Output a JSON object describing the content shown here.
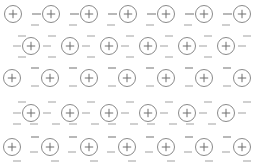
{
  "figure": {
    "width": 256,
    "height": 167,
    "background_color": "#ffffff",
    "ion_symbol": "+",
    "electron_symbol": "-",
    "ion_outline_color": "#8a8a8a",
    "ion_symbol_color": "#6f6f6f",
    "electron_color": "#9a9a9a",
    "ion_radius": 8.5,
    "ion_count": 33,
    "electron_count": 76,
    "row_count": 5
  },
  "lattice": {
    "rows": [
      {
        "index": 0,
        "label": "row-1",
        "y": 14,
        "start_x": 13,
        "spacing": 38.2,
        "ion_count": 7,
        "offset": "aligned"
      },
      {
        "index": 1,
        "label": "row-2",
        "y": 46,
        "start_x": 31,
        "spacing": 39.0,
        "ion_count": 6,
        "offset": "staggered"
      },
      {
        "index": 2,
        "label": "row-3",
        "y": 78,
        "start_x": 12,
        "spacing": 38.3,
        "ion_count": 7,
        "offset": "aligned"
      },
      {
        "index": 3,
        "label": "row-4",
        "y": 113,
        "start_x": 31,
        "spacing": 39.0,
        "ion_count": 6,
        "offset": "staggered"
      },
      {
        "index": 4,
        "label": "row-5",
        "y": 147,
        "start_x": 12,
        "spacing": 38.3,
        "ion_count": 7,
        "offset": "aligned"
      }
    ],
    "ions": [
      {
        "row": 0,
        "col": 0,
        "cx": 13,
        "cy": 14,
        "charge": "+"
      },
      {
        "row": 0,
        "col": 1,
        "cx": 51,
        "cy": 14,
        "charge": "+"
      },
      {
        "row": 0,
        "col": 2,
        "cx": 89,
        "cy": 14,
        "charge": "+"
      },
      {
        "row": 0,
        "col": 3,
        "cx": 128,
        "cy": 14,
        "charge": "+"
      },
      {
        "row": 0,
        "col": 4,
        "cx": 166,
        "cy": 14,
        "charge": "+"
      },
      {
        "row": 0,
        "col": 5,
        "cx": 204,
        "cy": 14,
        "charge": "+"
      },
      {
        "row": 0,
        "col": 6,
        "cx": 242,
        "cy": 14,
        "charge": "+"
      },
      {
        "row": 1,
        "col": 0,
        "cx": 31,
        "cy": 46,
        "charge": "+"
      },
      {
        "row": 1,
        "col": 1,
        "cx": 70,
        "cy": 46,
        "charge": "+"
      },
      {
        "row": 1,
        "col": 2,
        "cx": 109,
        "cy": 46,
        "charge": "+"
      },
      {
        "row": 1,
        "col": 3,
        "cx": 148,
        "cy": 46,
        "charge": "+"
      },
      {
        "row": 1,
        "col": 4,
        "cx": 187,
        "cy": 46,
        "charge": "+"
      },
      {
        "row": 1,
        "col": 5,
        "cx": 226,
        "cy": 46,
        "charge": "+"
      },
      {
        "row": 2,
        "col": 0,
        "cx": 12,
        "cy": 78,
        "charge": "+"
      },
      {
        "row": 2,
        "col": 1,
        "cx": 50,
        "cy": 78,
        "charge": "+"
      },
      {
        "row": 2,
        "col": 2,
        "cx": 89,
        "cy": 78,
        "charge": "+"
      },
      {
        "row": 2,
        "col": 3,
        "cx": 127,
        "cy": 78,
        "charge": "+"
      },
      {
        "row": 2,
        "col": 4,
        "cx": 166,
        "cy": 78,
        "charge": "+"
      },
      {
        "row": 2,
        "col": 5,
        "cx": 204,
        "cy": 78,
        "charge": "+"
      },
      {
        "row": 2,
        "col": 6,
        "cx": 242,
        "cy": 78,
        "charge": "+"
      },
      {
        "row": 3,
        "col": 0,
        "cx": 31,
        "cy": 113,
        "charge": "+"
      },
      {
        "row": 3,
        "col": 1,
        "cx": 70,
        "cy": 113,
        "charge": "+"
      },
      {
        "row": 3,
        "col": 2,
        "cx": 109,
        "cy": 113,
        "charge": "+"
      },
      {
        "row": 3,
        "col": 3,
        "cx": 148,
        "cy": 113,
        "charge": "+"
      },
      {
        "row": 3,
        "col": 4,
        "cx": 187,
        "cy": 113,
        "charge": "+"
      },
      {
        "row": 3,
        "col": 5,
        "cx": 226,
        "cy": 113,
        "charge": "+"
      },
      {
        "row": 4,
        "col": 0,
        "cx": 12,
        "cy": 147,
        "charge": "+"
      },
      {
        "row": 4,
        "col": 1,
        "cx": 50,
        "cy": 147,
        "charge": "+"
      },
      {
        "row": 4,
        "col": 2,
        "cx": 89,
        "cy": 147,
        "charge": "+"
      },
      {
        "row": 4,
        "col": 3,
        "cx": 127,
        "cy": 147,
        "charge": "+"
      },
      {
        "row": 4,
        "col": 4,
        "cx": 166,
        "cy": 147,
        "charge": "+"
      },
      {
        "row": 4,
        "col": 5,
        "cx": 204,
        "cy": 147,
        "charge": "+"
      },
      {
        "row": 4,
        "col": 6,
        "cx": 242,
        "cy": 147,
        "charge": "+"
      }
    ],
    "electrons": [
      {
        "x": 32,
        "y": 14,
        "w": 9,
        "faint": false
      },
      {
        "x": 70,
        "y": 14,
        "w": 9,
        "faint": false
      },
      {
        "x": 108,
        "y": 14,
        "w": 9,
        "faint": false
      },
      {
        "x": 147,
        "y": 14,
        "w": 9,
        "faint": false
      },
      {
        "x": 185,
        "y": 14,
        "w": 9,
        "faint": false
      },
      {
        "x": 223,
        "y": 14,
        "w": 9,
        "faint": false
      },
      {
        "x": 31,
        "y": 25,
        "w": 8,
        "faint": true
      },
      {
        "x": 69,
        "y": 25,
        "w": 8,
        "faint": true
      },
      {
        "x": 107,
        "y": 25,
        "w": 8,
        "faint": true
      },
      {
        "x": 146,
        "y": 25,
        "w": 8,
        "faint": true
      },
      {
        "x": 184,
        "y": 25,
        "w": 8,
        "faint": true
      },
      {
        "x": 222,
        "y": 25,
        "w": 8,
        "faint": true
      },
      {
        "x": 18,
        "y": 36,
        "w": 8,
        "faint": true
      },
      {
        "x": 48,
        "y": 36,
        "w": 8,
        "faint": true
      },
      {
        "x": 87,
        "y": 36,
        "w": 8,
        "faint": true
      },
      {
        "x": 126,
        "y": 36,
        "w": 8,
        "faint": true
      },
      {
        "x": 165,
        "y": 36,
        "w": 8,
        "faint": true
      },
      {
        "x": 204,
        "y": 36,
        "w": 8,
        "faint": true
      },
      {
        "x": 243,
        "y": 36,
        "w": 8,
        "faint": true
      },
      {
        "x": 13,
        "y": 46,
        "w": 8,
        "faint": true
      },
      {
        "x": 43,
        "y": 46,
        "w": 8,
        "faint": true
      },
      {
        "x": 82,
        "y": 46,
        "w": 8,
        "faint": true
      },
      {
        "x": 121,
        "y": 46,
        "w": 8,
        "faint": true
      },
      {
        "x": 160,
        "y": 46,
        "w": 8,
        "faint": true
      },
      {
        "x": 199,
        "y": 46,
        "w": 8,
        "faint": true
      },
      {
        "x": 238,
        "y": 46,
        "w": 8,
        "faint": true
      },
      {
        "x": 18,
        "y": 57,
        "w": 8,
        "faint": true
      },
      {
        "x": 48,
        "y": 57,
        "w": 8,
        "faint": true
      },
      {
        "x": 87,
        "y": 57,
        "w": 8,
        "faint": true
      },
      {
        "x": 126,
        "y": 57,
        "w": 8,
        "faint": true
      },
      {
        "x": 165,
        "y": 57,
        "w": 8,
        "faint": true
      },
      {
        "x": 204,
        "y": 57,
        "w": 8,
        "faint": true
      },
      {
        "x": 31,
        "y": 68,
        "w": 8,
        "faint": false
      },
      {
        "x": 69,
        "y": 68,
        "w": 8,
        "faint": false
      },
      {
        "x": 108,
        "y": 68,
        "w": 8,
        "faint": false
      },
      {
        "x": 146,
        "y": 68,
        "w": 8,
        "faint": false
      },
      {
        "x": 185,
        "y": 68,
        "w": 8,
        "faint": false
      },
      {
        "x": 223,
        "y": 68,
        "w": 8,
        "faint": false
      },
      {
        "x": 31,
        "y": 86,
        "w": 8,
        "faint": true
      },
      {
        "x": 69,
        "y": 86,
        "w": 8,
        "faint": true
      },
      {
        "x": 108,
        "y": 86,
        "w": 8,
        "faint": true
      },
      {
        "x": 146,
        "y": 86,
        "w": 8,
        "faint": true
      },
      {
        "x": 185,
        "y": 86,
        "w": 8,
        "faint": true
      },
      {
        "x": 223,
        "y": 86,
        "w": 8,
        "faint": true
      },
      {
        "x": 18,
        "y": 102,
        "w": 8,
        "faint": true
      },
      {
        "x": 48,
        "y": 102,
        "w": 8,
        "faint": true
      },
      {
        "x": 87,
        "y": 102,
        "w": 8,
        "faint": true
      },
      {
        "x": 126,
        "y": 102,
        "w": 8,
        "faint": true
      },
      {
        "x": 165,
        "y": 102,
        "w": 8,
        "faint": true
      },
      {
        "x": 204,
        "y": 102,
        "w": 8,
        "faint": true
      },
      {
        "x": 243,
        "y": 102,
        "w": 8,
        "faint": true
      },
      {
        "x": 13,
        "y": 113,
        "w": 8,
        "faint": true
      },
      {
        "x": 43,
        "y": 113,
        "w": 8,
        "faint": true
      },
      {
        "x": 82,
        "y": 113,
        "w": 8,
        "faint": true
      },
      {
        "x": 121,
        "y": 113,
        "w": 8,
        "faint": true
      },
      {
        "x": 160,
        "y": 113,
        "w": 8,
        "faint": true
      },
      {
        "x": 199,
        "y": 113,
        "w": 8,
        "faint": true
      },
      {
        "x": 238,
        "y": 113,
        "w": 8,
        "faint": true
      },
      {
        "x": 13,
        "y": 124,
        "w": 8,
        "faint": true
      },
      {
        "x": 30,
        "y": 124,
        "w": 8,
        "faint": true
      },
      {
        "x": 52,
        "y": 124,
        "w": 8,
        "faint": true
      },
      {
        "x": 69,
        "y": 124,
        "w": 8,
        "faint": true
      },
      {
        "x": 91,
        "y": 124,
        "w": 8,
        "faint": true
      },
      {
        "x": 108,
        "y": 124,
        "w": 8,
        "faint": true
      },
      {
        "x": 130,
        "y": 124,
        "w": 8,
        "faint": true
      },
      {
        "x": 147,
        "y": 124,
        "w": 8,
        "faint": true
      },
      {
        "x": 169,
        "y": 124,
        "w": 8,
        "faint": true
      },
      {
        "x": 186,
        "y": 124,
        "w": 8,
        "faint": true
      },
      {
        "x": 208,
        "y": 124,
        "w": 8,
        "faint": true
      },
      {
        "x": 31,
        "y": 137,
        "w": 8,
        "faint": false
      },
      {
        "x": 69,
        "y": 137,
        "w": 8,
        "faint": false
      },
      {
        "x": 108,
        "y": 137,
        "w": 8,
        "faint": false
      },
      {
        "x": 146,
        "y": 137,
        "w": 8,
        "faint": false
      },
      {
        "x": 185,
        "y": 137,
        "w": 8,
        "faint": false
      },
      {
        "x": 223,
        "y": 137,
        "w": 8,
        "faint": false
      },
      {
        "x": 30,
        "y": 152,
        "w": 8,
        "faint": true
      },
      {
        "x": 68,
        "y": 152,
        "w": 8,
        "faint": true
      },
      {
        "x": 107,
        "y": 152,
        "w": 8,
        "faint": true
      },
      {
        "x": 145,
        "y": 152,
        "w": 8,
        "faint": true
      },
      {
        "x": 184,
        "y": 152,
        "w": 8,
        "faint": true
      },
      {
        "x": 222,
        "y": 152,
        "w": 8,
        "faint": true
      },
      {
        "x": 13,
        "y": 161,
        "w": 8,
        "faint": true
      },
      {
        "x": 51,
        "y": 161,
        "w": 8,
        "faint": true
      },
      {
        "x": 90,
        "y": 161,
        "w": 8,
        "faint": true
      },
      {
        "x": 128,
        "y": 161,
        "w": 8,
        "faint": true
      },
      {
        "x": 167,
        "y": 161,
        "w": 8,
        "faint": true
      },
      {
        "x": 205,
        "y": 161,
        "w": 8,
        "faint": true
      },
      {
        "x": 243,
        "y": 161,
        "w": 8,
        "faint": true
      }
    ]
  }
}
